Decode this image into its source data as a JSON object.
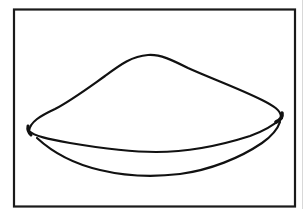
{
  "figure": {
    "frame": {
      "stroke_color": "#1a1a1a",
      "background": "#ffffff"
    },
    "drawing": {
      "stroke_color": "#111111",
      "parts": [
        "mound-outline",
        "dish-rim",
        "dish-bottom"
      ]
    }
  }
}
